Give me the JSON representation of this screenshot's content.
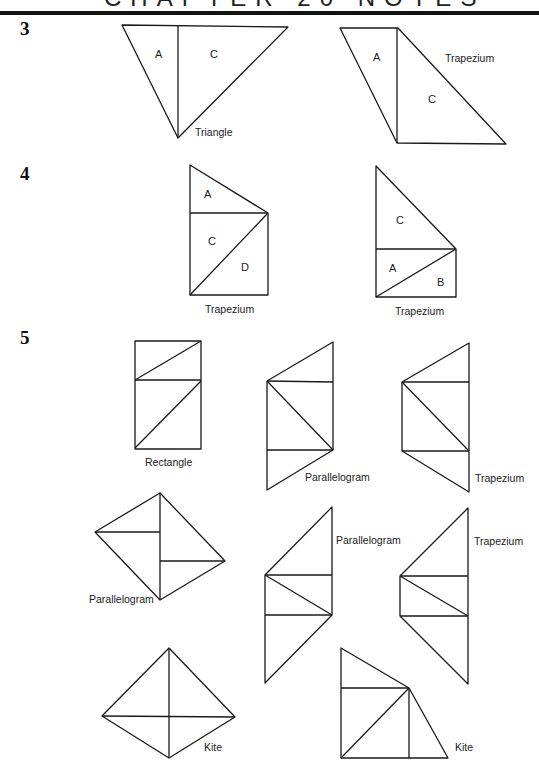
{
  "header": {
    "title": "CHAPTER 20 NOTES"
  },
  "questions": [
    {
      "number": "3"
    },
    {
      "number": "4"
    },
    {
      "number": "5"
    }
  ],
  "q3": {
    "fig1": {
      "caption": "Triangle",
      "pieces": [
        "A",
        "C"
      ]
    },
    "fig2": {
      "caption": "Trapezium",
      "pieces": [
        "A",
        "C"
      ]
    }
  },
  "q4": {
    "fig1": {
      "caption": "Trapezium",
      "pieces": [
        "A",
        "C",
        "D"
      ]
    },
    "fig2": {
      "caption": "Trapezium",
      "pieces": [
        "C",
        "A",
        "B"
      ]
    }
  },
  "q5": {
    "figures": [
      {
        "caption": "Rectangle"
      },
      {
        "caption": "Parallelogram"
      },
      {
        "caption": "Trapezium"
      },
      {
        "caption": "Parallelogram"
      },
      {
        "caption": "Parallelogram"
      },
      {
        "caption": "Trapezium"
      },
      {
        "caption": "Kite"
      },
      {
        "caption": "Kite"
      }
    ]
  }
}
